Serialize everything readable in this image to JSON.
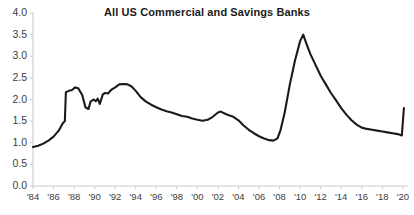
{
  "chart_data": {
    "type": "line",
    "title": "All US Commercial and Savings Banks",
    "xlabel": "",
    "ylabel": "",
    "ylim": [
      0.0,
      4.0
    ],
    "xlim": [
      1984,
      2020.5
    ],
    "grid": false,
    "legend": null,
    "y_ticks": [
      "0.0",
      "0.5",
      "1.0",
      "1.5",
      "2.0",
      "2.5",
      "3.0",
      "3.5",
      "4.0"
    ],
    "y_tick_values": [
      0.0,
      0.5,
      1.0,
      1.5,
      2.0,
      2.5,
      3.0,
      3.5,
      4.0
    ],
    "x_ticks": [
      "'84",
      "'86",
      "'88",
      "'90",
      "'92",
      "'94",
      "'96",
      "'98",
      "'00",
      "'02",
      "'04",
      "'06",
      "'08",
      "'10",
      "'12",
      "'14",
      "'16",
      "'18",
      "'20"
    ],
    "x_tick_values": [
      1984,
      1986,
      1988,
      1990,
      1992,
      1994,
      1996,
      1998,
      2000,
      2002,
      2004,
      2006,
      2008,
      2010,
      2012,
      2014,
      2016,
      2018,
      2020
    ],
    "annotations": [
      {
        "text": "1.80%",
        "x": 2020.25,
        "y": 1.8
      }
    ],
    "series": [
      {
        "name": "All US Commercial and Savings Banks",
        "color": "#1a1a1a",
        "x": [
          1984.0,
          1984.5,
          1985.0,
          1985.5,
          1986.0,
          1986.5,
          1986.9,
          1987.1,
          1987.2,
          1987.5,
          1987.8,
          1988.1,
          1988.4,
          1988.8,
          1989.1,
          1989.4,
          1989.6,
          1989.9,
          1990.1,
          1990.3,
          1990.5,
          1990.8,
          1991.0,
          1991.3,
          1991.6,
          1992.0,
          1992.4,
          1992.8,
          1993.2,
          1993.6,
          1994.0,
          1994.5,
          1995.0,
          1995.5,
          1996.0,
          1996.5,
          1997.0,
          1997.5,
          1998.0,
          1998.5,
          1999.0,
          1999.5,
          2000.0,
          2000.5,
          2001.0,
          2001.5,
          2002.0,
          2002.3,
          2002.6,
          2003.0,
          2003.5,
          2004.0,
          2004.5,
          2005.0,
          2005.5,
          2006.0,
          2006.5,
          2007.0,
          2007.4,
          2007.8,
          2008.1,
          2008.5,
          2009.0,
          2009.5,
          2010.0,
          2010.3,
          2010.6,
          2011.0,
          2011.5,
          2012.0,
          2012.5,
          2013.0,
          2013.5,
          2014.0,
          2014.5,
          2015.0,
          2015.5,
          2016.0,
          2016.5,
          2017.0,
          2017.5,
          2018.0,
          2018.5,
          2019.0,
          2019.5,
          2019.9,
          2020.1
        ],
        "y": [
          0.9,
          0.93,
          0.98,
          1.05,
          1.14,
          1.28,
          1.45,
          1.5,
          2.17,
          2.2,
          2.22,
          2.28,
          2.26,
          2.1,
          1.82,
          1.78,
          1.95,
          2.0,
          1.96,
          2.02,
          1.9,
          2.12,
          2.15,
          2.14,
          2.22,
          2.28,
          2.35,
          2.36,
          2.35,
          2.3,
          2.2,
          2.05,
          1.95,
          1.88,
          1.82,
          1.77,
          1.73,
          1.7,
          1.66,
          1.62,
          1.6,
          1.56,
          1.53,
          1.51,
          1.53,
          1.6,
          1.7,
          1.72,
          1.68,
          1.64,
          1.6,
          1.52,
          1.4,
          1.3,
          1.22,
          1.15,
          1.1,
          1.06,
          1.05,
          1.1,
          1.3,
          1.7,
          2.35,
          2.9,
          3.35,
          3.5,
          3.3,
          3.05,
          2.8,
          2.55,
          2.35,
          2.15,
          1.98,
          1.8,
          1.65,
          1.52,
          1.42,
          1.35,
          1.32,
          1.3,
          1.28,
          1.26,
          1.24,
          1.22,
          1.2,
          1.17,
          1.8
        ]
      }
    ]
  },
  "axes": {
    "axis_color": "#c8c8c8",
    "tick_color": "#c8c8c8",
    "label_color": "#3d3d3d"
  }
}
